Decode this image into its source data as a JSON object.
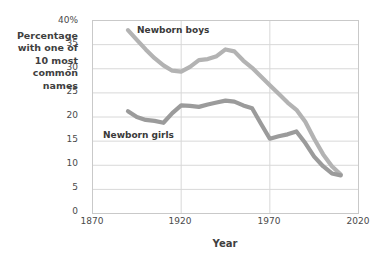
{
  "chart_data": {
    "type": "line",
    "title": "",
    "xlabel": "Year",
    "ylabel": "Percentage with one of 10 most common names",
    "ylabel_lines": "Percentage\nwith one of\n10 most\ncommon\nnames",
    "xlim": [
      1870,
      2020
    ],
    "ylim": [
      0,
      40
    ],
    "grid": true,
    "legend_position": "inline-annotations",
    "xticks": [
      "1870",
      "1920",
      "1970",
      "2020"
    ],
    "xtick_values": [
      1870,
      1920,
      1970,
      2020
    ],
    "yticks": [
      "0",
      "5",
      "10",
      "15",
      "20",
      "25",
      "30",
      "35",
      "40%"
    ],
    "ytick_values": [
      0,
      5,
      10,
      15,
      20,
      25,
      30,
      35,
      40
    ],
    "series": [
      {
        "name": "Newborn boys",
        "color": "#b3b3b3",
        "x": [
          1890,
          1895,
          1900,
          1905,
          1910,
          1915,
          1920,
          1925,
          1930,
          1935,
          1940,
          1945,
          1950,
          1955,
          1960,
          1965,
          1970,
          1975,
          1980,
          1985,
          1990,
          1995,
          2000,
          2005,
          2010
        ],
        "values": [
          38.0,
          36.0,
          34.0,
          32.2,
          30.7,
          29.6,
          29.4,
          30.4,
          31.8,
          32.0,
          32.6,
          34.0,
          33.6,
          31.7,
          30.2,
          28.4,
          26.6,
          24.8,
          23.0,
          21.5,
          19.0,
          15.5,
          12.3,
          9.8,
          8.1
        ]
      },
      {
        "name": "Newborn girls",
        "color": "#9b9b9b",
        "x": [
          1890,
          1895,
          1900,
          1905,
          1910,
          1915,
          1920,
          1925,
          1930,
          1935,
          1940,
          1945,
          1950,
          1955,
          1960,
          1965,
          1970,
          1975,
          1980,
          1985,
          1990,
          1995,
          2000,
          2005,
          2010
        ],
        "values": [
          21.2,
          20.0,
          19.4,
          19.2,
          18.8,
          20.8,
          22.4,
          22.3,
          22.1,
          22.6,
          23.0,
          23.4,
          23.2,
          22.4,
          21.8,
          18.6,
          15.5,
          16.0,
          16.4,
          17.0,
          14.6,
          11.8,
          9.8,
          8.3,
          7.9
        ]
      }
    ],
    "annotations": [
      {
        "text": "Newborn boys",
        "x": 1906,
        "y": 37.5
      },
      {
        "text": "Newborn girls",
        "x": 1894,
        "y": 17.0
      }
    ]
  },
  "style": {
    "plot_border_color": "#c9c9c9",
    "grid_color": "#d8d8d8",
    "background": "#ffffff",
    "text_color": "#3f3f3f"
  }
}
